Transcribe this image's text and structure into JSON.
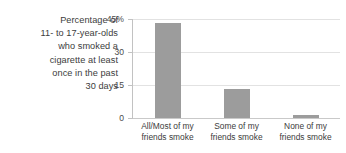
{
  "caption": {
    "lines": [
      "Percentage of",
      "11- to 17-year-olds",
      "who smoked a",
      "cigarette at least",
      "once in the past",
      "30 days"
    ],
    "full_text": "Percentage of 11- to 17-year-olds who smoked a cigarette at least once in the past 30 days"
  },
  "colors": {
    "bar": "#9c9c9c",
    "gridline": "#e2e2e2",
    "axis": "#c2c2c2",
    "text": "#3c3c3c",
    "background": "#ffffff"
  },
  "chart_data": {
    "type": "bar",
    "title": "",
    "subtitle": "",
    "xlabel": "",
    "ylabel": "Percentage of 11- to 17-year-olds who smoked a cigarette at least once in the past 30 days",
    "categories": [
      "All/Most of my friends smoke",
      "Some of my friends smoke",
      "None of my friends smoke"
    ],
    "category_lines": [
      [
        "All/Most of my",
        "friends smoke"
      ],
      [
        "Some of my",
        "friends smoke"
      ],
      [
        "None of my",
        "friends smoke"
      ]
    ],
    "values": [
      43,
      13,
      1.5
    ],
    "ylim": [
      0,
      45
    ],
    "yticks": [
      0,
      15,
      30,
      45
    ],
    "ytick_labels": [
      "0",
      "15",
      "30",
      "45%"
    ],
    "grid": true,
    "legend": false,
    "legend_position": "none",
    "bar_color": "#9c9c9c"
  }
}
